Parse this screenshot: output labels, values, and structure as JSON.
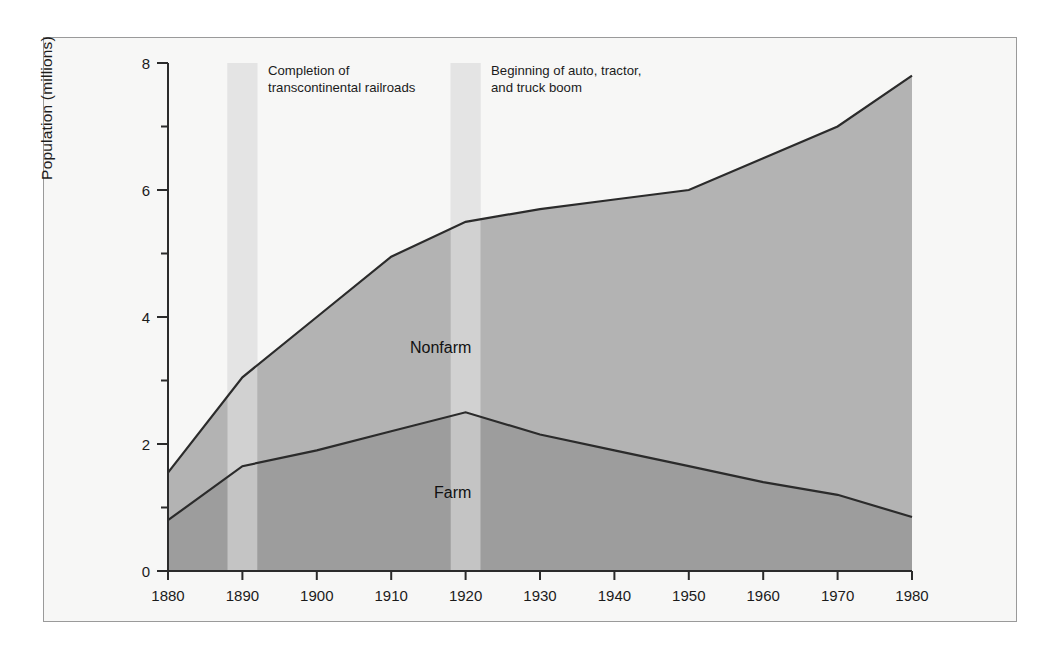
{
  "chart_data": {
    "type": "area",
    "title": "",
    "subtitle": "",
    "xlabel": "",
    "ylabel": "Population (millions)",
    "xlim": [
      1880,
      1980
    ],
    "ylim": [
      0,
      8
    ],
    "grid": false,
    "stacked": true,
    "legend_position": "inline-annotations",
    "x": [
      1880,
      1890,
      1900,
      1910,
      1920,
      1930,
      1940,
      1950,
      1960,
      1970,
      1980
    ],
    "xticks": [
      "1880",
      "1890",
      "1900",
      "1910",
      "1920",
      "1930",
      "1940",
      "1950",
      "1960",
      "1970",
      "1980"
    ],
    "yticks": [
      "0",
      "2",
      "4",
      "6",
      "8"
    ],
    "yticks_minor": [
      "1",
      "3",
      "5",
      "7"
    ],
    "series": [
      {
        "name": "Farm",
        "label": "Farm",
        "color": "#9a9a9a",
        "values": [
          0.8,
          1.65,
          1.9,
          2.2,
          2.5,
          2.15,
          1.9,
          1.65,
          1.4,
          1.2,
          0.85
        ]
      },
      {
        "name": "Nonfarm",
        "label": "Nonfarm",
        "color": "#b0b0b0",
        "cumulative_top": [
          1.55,
          3.05,
          4.0,
          4.95,
          5.5,
          5.7,
          5.85,
          6.0,
          6.5,
          7.0,
          7.8
        ],
        "values": [
          0.75,
          1.4,
          2.1,
          2.75,
          3.0,
          3.55,
          3.95,
          4.35,
          5.1,
          5.8,
          6.95
        ]
      }
    ],
    "annotations": [
      {
        "id": "transcontinental-railroads",
        "text": "Completion of\ntranscontinental railroads",
        "band_start": 1888,
        "band_end": 1892,
        "band_color": "#d0d0d0"
      },
      {
        "id": "auto-tractor-truck-boom",
        "text": "Beginning of auto, tractor,\nand truck boom",
        "band_start": 1918,
        "band_end": 1922,
        "band_color": "#d0d0d0"
      }
    ]
  },
  "figure": {
    "background": "#f7f7f6",
    "border_color": "#9a9a9a",
    "axis_color": "#2b2b2b"
  }
}
